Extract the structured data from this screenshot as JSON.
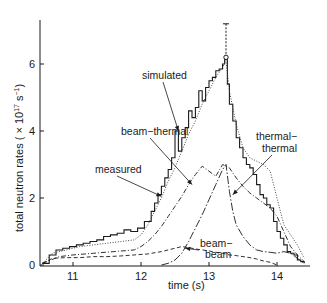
{
  "chart_data": {
    "type": "line",
    "title": "",
    "xlabel": "time (s)",
    "ylabel": "total neutron rates ( × 10¹⁷ s⁻¹)",
    "xlim": [
      10.55,
      14.45
    ],
    "ylim": [
      0,
      7.4
    ],
    "xticks": [
      11,
      12,
      13,
      14
    ],
    "yticks": [
      0,
      2,
      4,
      6
    ],
    "xtick_labels": [
      "11",
      "12",
      "13",
      "14"
    ],
    "ytick_labels": [
      "0",
      "2",
      "4",
      "6"
    ],
    "grid": false,
    "legend": "none (inline annotations with arrows)",
    "series": [
      {
        "name": "measured",
        "style": "solid-step",
        "color": "#1a1a1a",
        "x": [
          10.55,
          10.65,
          10.75,
          10.85,
          10.95,
          11.05,
          11.15,
          11.25,
          11.35,
          11.45,
          11.55,
          11.65,
          11.75,
          11.85,
          11.95,
          12.05,
          12.15,
          12.2,
          12.25,
          12.3,
          12.35,
          12.4,
          12.45,
          12.5,
          12.55,
          12.6,
          12.65,
          12.7,
          12.75,
          12.8,
          12.85,
          12.9,
          12.95,
          13.0,
          13.05,
          13.1,
          13.15,
          13.2,
          13.23,
          13.27,
          13.3,
          13.35,
          13.4,
          13.45,
          13.5,
          13.55,
          13.6,
          13.65,
          13.7,
          13.75,
          13.8,
          13.85,
          13.9,
          13.95,
          14.0,
          14.05,
          14.1,
          14.15,
          14.2,
          14.25,
          14.3,
          14.35,
          14.4
        ],
        "y": [
          0.05,
          0.3,
          0.45,
          0.5,
          0.55,
          0.6,
          0.65,
          0.7,
          0.75,
          0.85,
          0.9,
          0.95,
          1.05,
          1.0,
          1.1,
          1.3,
          1.6,
          1.85,
          2.1,
          2.35,
          2.6,
          2.85,
          3.2,
          4.0,
          3.4,
          3.8,
          4.1,
          4.6,
          4.4,
          4.7,
          5.2,
          4.9,
          5.3,
          5.5,
          5.6,
          5.8,
          5.85,
          6.0,
          6.2,
          5.4,
          4.8,
          4.3,
          3.8,
          3.5,
          3.2,
          3.0,
          2.9,
          2.7,
          2.4,
          2.1,
          2.0,
          1.8,
          1.7,
          1.3,
          1.0,
          0.8,
          0.6,
          0.4,
          0.35,
          0.3,
          0.15,
          0.1,
          0.05
        ]
      },
      {
        "name": "simulated",
        "style": "dotted",
        "color": "#333333",
        "x": [
          10.55,
          10.7,
          10.9,
          11.1,
          11.3,
          11.5,
          11.7,
          11.9,
          12.0,
          12.1,
          12.2,
          12.3,
          12.4,
          12.5,
          12.6,
          12.7,
          12.8,
          12.9,
          13.0,
          13.1,
          13.2,
          13.25,
          13.3,
          13.4,
          13.5,
          13.6,
          13.7,
          13.8,
          13.9,
          14.0,
          14.1,
          14.2,
          14.3,
          14.4
        ],
        "y": [
          0.05,
          0.35,
          0.45,
          0.55,
          0.6,
          0.65,
          0.7,
          0.75,
          0.9,
          1.2,
          1.6,
          2.0,
          2.5,
          2.9,
          3.4,
          3.9,
          4.3,
          4.8,
          5.2,
          5.6,
          5.9,
          6.1,
          5.2,
          4.2,
          3.5,
          3.2,
          3.1,
          3.0,
          2.8,
          2.0,
          1.2,
          0.9,
          0.6,
          0.2
        ]
      },
      {
        "name": "beam-thermal",
        "style": "dash-dot",
        "color": "#1a1a1a",
        "x": [
          10.55,
          10.8,
          11.0,
          11.3,
          11.6,
          11.9,
          12.0,
          12.1,
          12.2,
          12.3,
          12.4,
          12.5,
          12.6,
          12.7,
          12.8,
          12.9,
          13.0,
          13.1,
          13.2,
          13.3,
          13.4,
          13.5,
          13.6,
          13.7,
          13.8,
          13.9,
          14.0,
          14.1,
          14.2,
          14.3,
          14.4
        ],
        "y": [
          0.05,
          0.25,
          0.3,
          0.35,
          0.4,
          0.45,
          0.55,
          0.7,
          0.9,
          1.15,
          1.45,
          1.75,
          2.05,
          2.4,
          2.7,
          2.95,
          2.8,
          2.65,
          3.0,
          2.9,
          2.6,
          2.35,
          2.15,
          2.0,
          1.85,
          1.7,
          1.45,
          1.0,
          0.55,
          0.3,
          0.1
        ]
      },
      {
        "name": "thermal-thermal",
        "style": "long-dash-dot",
        "color": "#1a1a1a",
        "x": [
          12.3,
          12.4,
          12.5,
          12.6,
          12.7,
          12.8,
          12.9,
          13.0,
          13.1,
          13.2,
          13.25,
          13.3,
          13.35,
          13.4,
          13.5,
          13.6,
          13.7,
          13.8,
          13.9,
          14.0,
          14.1,
          14.2,
          14.3,
          14.4
        ],
        "y": [
          0.0,
          0.05,
          0.15,
          0.35,
          0.7,
          1.1,
          1.5,
          1.95,
          2.4,
          2.85,
          3.0,
          2.2,
          1.6,
          1.2,
          0.85,
          0.6,
          0.45,
          0.4,
          0.38,
          0.35,
          0.4,
          0.35,
          0.2,
          0.05
        ]
      },
      {
        "name": "beam-beam",
        "style": "dashed",
        "color": "#1a1a1a",
        "x": [
          10.55,
          10.7,
          10.9,
          11.1,
          11.3,
          11.5,
          11.7,
          11.9,
          12.1,
          12.3,
          12.5,
          12.6,
          12.7,
          12.8,
          12.9,
          13.0,
          13.1,
          13.2,
          13.3,
          13.4,
          13.5,
          13.6,
          13.7,
          13.8,
          13.9,
          14.0
        ],
        "y": [
          0.05,
          0.2,
          0.22,
          0.22,
          0.25,
          0.25,
          0.27,
          0.3,
          0.33,
          0.4,
          0.5,
          0.55,
          0.52,
          0.48,
          0.45,
          0.42,
          0.38,
          0.35,
          0.3,
          0.28,
          0.25,
          0.22,
          0.18,
          0.12,
          0.08,
          0.0
        ]
      }
    ],
    "annotations": [
      {
        "text": "simulated",
        "label_at": [
          12.05,
          5.6
        ],
        "arrow_to": [
          12.55,
          4.0
        ]
      },
      {
        "text": "beam−thermal",
        "label_at": [
          11.75,
          3.9
        ],
        "arrow_to": [
          12.75,
          2.4
        ]
      },
      {
        "text": "measured",
        "label_at": [
          11.3,
          2.7
        ],
        "arrow_to": [
          12.3,
          2.05
        ]
      },
      {
        "text": "thermal−thermal",
        "label_at": [
          13.85,
          3.8
        ],
        "arrow_to": [
          13.35,
          2.1
        ]
      },
      {
        "text": "beam−beam",
        "label_at": [
          12.9,
          0.75
        ],
        "arrow_to": [
          12.65,
          0.5
        ]
      }
    ],
    "peak_marker": {
      "t": 13.25,
      "value": 6.2,
      "error_bar_top": 7.2
    }
  },
  "axes": {
    "x_label": "time (s)",
    "y_label_main": "total neutron rates ( × 10",
    "y_label_exp": "17",
    "y_label_unit": " s",
    "y_label_unit_exp": "−1",
    "y_label_close": ")"
  },
  "annotation_labels": {
    "simulated": "simulated",
    "beam_thermal": "beam−thermal",
    "measured": "measured",
    "thermal_thermal_1": "thermal−",
    "thermal_thermal_2": "thermal",
    "beam_beam_1": "beam−",
    "beam_beam_2": "beam"
  }
}
